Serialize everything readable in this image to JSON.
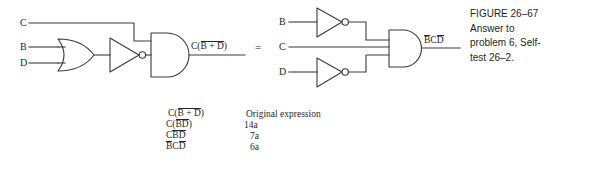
{
  "figure": {
    "caption_lines": [
      "FIGURE 26–67",
      "Answer to",
      "problem 6, Self-",
      "test 26–2."
    ]
  },
  "equivalence": {
    "equals_symbol": "="
  },
  "left_circuit": {
    "name": "original-circuit",
    "inputs": [
      {
        "label": "C"
      },
      {
        "label": "B"
      },
      {
        "label": "D"
      }
    ],
    "gates": [
      {
        "type": "or-gate",
        "inputs": [
          "B",
          "D"
        ]
      },
      {
        "type": "inverter",
        "inputs": [
          "B+D"
        ]
      },
      {
        "type": "and-gate",
        "inputs": [
          "C",
          "NOT(B+D)"
        ]
      }
    ],
    "output": {
      "prefix": "C(",
      "overbar": "B + D",
      "suffix": ")"
    }
  },
  "right_circuit": {
    "name": "simplified-circuit",
    "inputs": [
      {
        "label": "B"
      },
      {
        "label": "C"
      },
      {
        "label": "D"
      }
    ],
    "gates": [
      {
        "type": "inverter",
        "inputs": [
          "B"
        ]
      },
      {
        "type": "inverter",
        "inputs": [
          "D"
        ]
      },
      {
        "type": "and-gate",
        "inputs": [
          "NOT B",
          "C",
          "NOT D"
        ]
      }
    ],
    "output": {
      "b_bar": "B",
      "c": "C",
      "d_bar": "D"
    }
  },
  "derivation": {
    "rows": [
      {
        "expr_parts": {
          "pre": "C(",
          "bar": "B + D",
          "post": ")"
        },
        "note": "Original expression"
      },
      {
        "expr_parts": {
          "pre": "C(",
          "b": "B",
          "d": "D",
          "post": ")"
        },
        "note": "14a"
      },
      {
        "expr_parts": {
          "pre": "C",
          "b": "B",
          "d": "D",
          "post": ""
        },
        "note": "7a"
      },
      {
        "expr_parts": {
          "b": "B",
          "mid": "C",
          "d": "D"
        },
        "note": "6a"
      }
    ],
    "row0_note": "Original expression",
    "row1_note": "14a",
    "row2_note": "7a",
    "row3_note": "6a"
  },
  "colors": {
    "line": "#3a3a42",
    "text": "#262626",
    "caption_text": "#1f1f1f",
    "background": "#ffffff"
  }
}
